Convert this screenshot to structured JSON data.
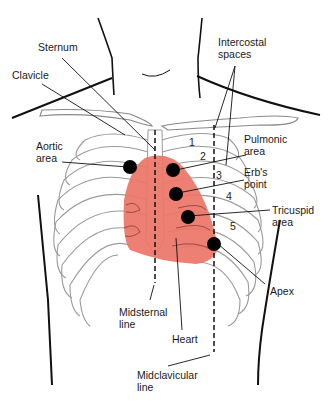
{
  "diagram": {
    "type": "anatomical illustration",
    "colors": {
      "heart": "#ec7467",
      "lines": "#111111",
      "ribs": "#9a9a9a",
      "dots": "#000000"
    }
  },
  "labels": {
    "sternum": "Sternum",
    "clavicle": "Clavicle",
    "intercostal_spaces": "Intercostal\nspaces",
    "aortic_area": "Aortic\narea",
    "pulmonic_area": "Pulmonic\narea",
    "erbs_point": "Erb's\npoint",
    "tricuspid_area": "Tricuspid\narea",
    "apex": "Apex",
    "midsternal_line": "Midsternal\nline",
    "heart": "Heart",
    "midclavicular_line": "Midclavicular\nline"
  },
  "intercostal_numbers": [
    "1",
    "2",
    "3",
    "4",
    "5"
  ]
}
